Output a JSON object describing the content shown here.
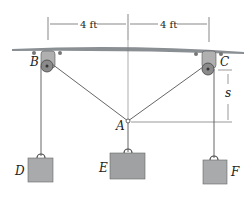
{
  "diagram": {
    "dimensions": {
      "left_span": "4 ft",
      "right_span": "4 ft",
      "vertical": "s"
    },
    "points": {
      "B": "B",
      "C": "C",
      "A": "A"
    },
    "weights": {
      "D": "D",
      "E": "E",
      "F": "F"
    },
    "colors": {
      "ceiling": "#8a8f94",
      "weight": "#a9aaab",
      "pulley": "#9a9a9a",
      "line": "#555555"
    }
  }
}
